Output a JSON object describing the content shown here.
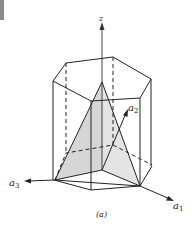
{
  "figure": {
    "caption": "(a)",
    "axes": {
      "z": "z",
      "a1": "a",
      "a1_sub": "1",
      "a2": "a",
      "a2_sub": "2",
      "a3": "a",
      "a3_sub": "3"
    },
    "colors": {
      "line": "#222222",
      "shade": "#d9d9d9",
      "tab": "#8a8a8a"
    }
  }
}
